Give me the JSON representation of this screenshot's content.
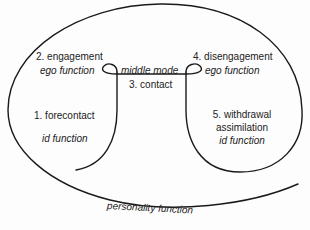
{
  "diagram": {
    "type": "gestalt-contact-cycle",
    "stroke_color": "#1a1a1a",
    "labels": {
      "engagement": "2. engagement",
      "engagement_func": "ego function",
      "middle_mode": "middle mode",
      "disengagement": "4. disengagement",
      "disengagement_func": "ego function",
      "contact": "3. contact",
      "forecontact": "1. forecontact",
      "forecontact_func": "id function",
      "withdrawal": "5. withdrawal",
      "assimilation": "assimilation",
      "withdrawal_func": "id function",
      "personality": "personality function"
    }
  }
}
